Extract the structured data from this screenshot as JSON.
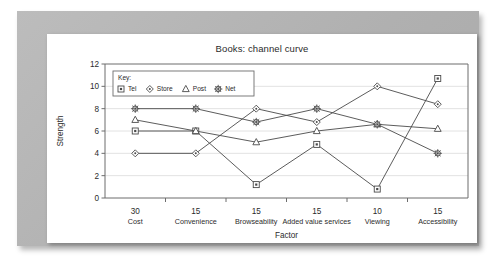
{
  "chart_data": {
    "type": "line",
    "title": "Books: channel curve",
    "xlabel": "Factor",
    "ylabel": "Strength",
    "ylim": [
      0,
      12
    ],
    "ytick_step": 2,
    "yticks": [
      "0",
      "2",
      "4",
      "6",
      "8",
      "10",
      "12"
    ],
    "grid": true,
    "grid_axis": "y",
    "legend_position": "top-left-inside",
    "legend_title": "Key:",
    "categories": [
      "Cost",
      "Convenience",
      "Browseability",
      "Added value services",
      "Viewing",
      "Accessibility"
    ],
    "category_weights": [
      "30",
      "15",
      "15",
      "15",
      "10",
      "15"
    ],
    "series": [
      {
        "name": "Tel",
        "marker": "square",
        "values": [
          6,
          6,
          1.2,
          4.8,
          0.8,
          10.7
        ]
      },
      {
        "name": "Store",
        "marker": "diamond",
        "values": [
          4,
          4,
          8,
          6.8,
          10,
          8.4
        ]
      },
      {
        "name": "Post",
        "marker": "triangle",
        "values": [
          7,
          6,
          5,
          6,
          6.6,
          6.2
        ]
      },
      {
        "name": "Net",
        "marker": "asterisk",
        "values": [
          8,
          8,
          6.8,
          8,
          6.6,
          4
        ]
      }
    ]
  },
  "colors": {
    "mount": "#b4b4b4",
    "card": "#ffffff",
    "ink": "#2b2b2b",
    "line": "#4a4a4a",
    "grid": "#e2e2e2",
    "axis": "#6d6d6d"
  }
}
